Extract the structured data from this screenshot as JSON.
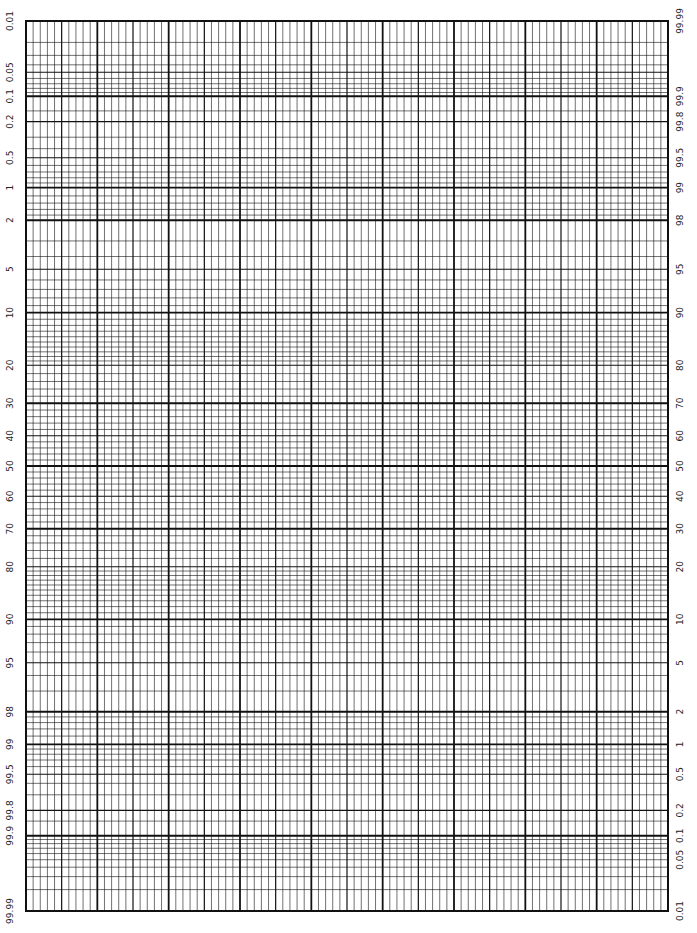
{
  "chart_data": {
    "type": "table",
    "title": "",
    "xlabel": "",
    "ylabel": "Cumulative probability (%)",
    "left_axis_labels": [
      "0.01",
      "0.05",
      "0.1",
      "0.2",
      "0.5",
      "1",
      "2",
      "5",
      "10",
      "20",
      "30",
      "40",
      "50",
      "60",
      "70",
      "80",
      "90",
      "95",
      "98",
      "99",
      "99.5",
      "99.8",
      "99.9",
      "99.99"
    ],
    "right_axis_labels": [
      "99.99",
      "99.9",
      "99.8",
      "99.5",
      "99",
      "98",
      "95",
      "90",
      "80",
      "70",
      "60",
      "50",
      "40",
      "30",
      "20",
      "10",
      "5",
      "2",
      "1",
      "0.5",
      "0.2",
      "0.1",
      "0.05",
      "0.01"
    ],
    "ylim": [
      0.01,
      99.99
    ],
    "x_major_divisions": 9,
    "x_minor_per_major": 10,
    "grid": true,
    "series": []
  },
  "layout": {
    "plot_left": 26,
    "plot_right": 668,
    "plot_top": 21,
    "plot_bottom": 911,
    "z_max": 3.719,
    "line_color": "#111111"
  },
  "heavy_probs": [
    0.1,
    1,
    2,
    10,
    30,
    50,
    70,
    90,
    98,
    99,
    99.9
  ],
  "medium_probs": [
    0.05,
    0.2,
    0.5,
    5,
    20,
    40,
    60,
    80,
    95,
    99.5,
    99.8
  ],
  "minor_probs": [
    0.02,
    0.03,
    0.04,
    0.06,
    0.07,
    0.08,
    0.09,
    0.15,
    0.3,
    0.4,
    0.6,
    0.7,
    0.8,
    0.9,
    1.2,
    1.4,
    1.6,
    1.8,
    3,
    4,
    6,
    7,
    8,
    9,
    11,
    12,
    13,
    14,
    15,
    16,
    17,
    18,
    19,
    22,
    24,
    26,
    28,
    32,
    34,
    36,
    38,
    42,
    44,
    46,
    48,
    52,
    54,
    56,
    58,
    62,
    64,
    66,
    68,
    72,
    74,
    76,
    78,
    81,
    82,
    83,
    84,
    85,
    86,
    87,
    88,
    89,
    91,
    92,
    93,
    94,
    96,
    97,
    98.2,
    98.4,
    98.6,
    98.8,
    99.1,
    99.2,
    99.3,
    99.4,
    99.6,
    99.7,
    99.85,
    99.91,
    99.92,
    99.93,
    99.94,
    99.95,
    99.96,
    99.97,
    99.98
  ]
}
